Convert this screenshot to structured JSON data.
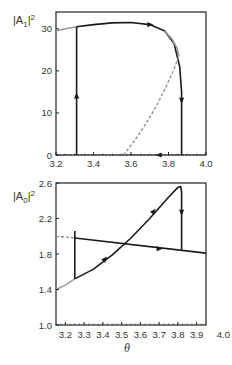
{
  "chart_data": [
    {
      "type": "line",
      "panel": "top",
      "ylabel": "|A1|^2",
      "ylabel_parts": {
        "base": "|A",
        "sub": "1",
        "tail": "|",
        "sup": "2"
      },
      "xlabel": "",
      "xlim": [
        3.2,
        4.0
      ],
      "ylim": [
        0,
        34
      ],
      "xticks": [
        3.2,
        3.4,
        3.6,
        3.8,
        4.0
      ],
      "xtick_labels": [
        "3.2",
        "3.4",
        "3.6",
        "3.8",
        "4.0"
      ],
      "yticks": [
        0,
        10,
        20,
        30
      ],
      "ytick_labels": [
        "0",
        "10",
        "20",
        "30"
      ],
      "grid": false,
      "series": [
        {
          "name": "stable upper branch (gray)",
          "style": "solid-gray",
          "x": [
            3.2,
            3.25,
            3.31
          ],
          "y": [
            29.5,
            30.0,
            30.5
          ]
        },
        {
          "name": "stable upper branch (black)",
          "style": "solid-black",
          "x": [
            3.31,
            3.4,
            3.5,
            3.6,
            3.7,
            3.78,
            3.83,
            3.86,
            3.87,
            3.87
          ],
          "y": [
            30.5,
            31.0,
            31.4,
            31.5,
            31.0,
            29.5,
            26.5,
            21.0,
            15.0,
            0
          ]
        },
        {
          "name": "upper branch near fold (gray)",
          "style": "solid-gray",
          "x": [
            3.78,
            3.82,
            3.845,
            3.855
          ],
          "y": [
            29.5,
            27.5,
            25.5,
            23.5
          ]
        },
        {
          "name": "unstable branch",
          "style": "dashed-gray",
          "x": [
            3.56,
            3.62,
            3.68,
            3.74,
            3.79,
            3.83,
            3.855
          ],
          "y": [
            0,
            3.5,
            7.5,
            12.0,
            16.5,
            20.5,
            23.5
          ]
        },
        {
          "name": "trivial branch",
          "style": "dashed-black",
          "x": [
            3.2,
            4.0
          ],
          "y": [
            0,
            0
          ]
        },
        {
          "name": "jump up",
          "style": "solid-black",
          "x": [
            3.31,
            3.31
          ],
          "y": [
            0,
            30.5
          ]
        }
      ],
      "arrows": [
        {
          "x": 3.31,
          "y": 14,
          "direction": "up"
        },
        {
          "x": 3.7,
          "y": 31.0,
          "direction": "right"
        },
        {
          "x": 3.87,
          "y": 13,
          "direction": "down"
        },
        {
          "x": 3.75,
          "y": 0,
          "direction": "left"
        }
      ]
    },
    {
      "type": "line",
      "panel": "bottom",
      "ylabel": "|A0|^2",
      "ylabel_parts": {
        "base": "|A",
        "sub": "0",
        "tail": "|",
        "sup": "2"
      },
      "xlabel": "θ",
      "xlim": [
        3.15,
        3.95
      ],
      "ylim": [
        1.0,
        2.6
      ],
      "xticks": [
        3.2,
        3.3,
        3.4,
        3.5,
        3.6,
        3.7,
        3.8,
        3.9,
        4.0
      ],
      "xtick_labels": [
        "3.2",
        "3.3",
        "3.4",
        "3.5",
        "3.6",
        "3.7",
        "3.8",
        "3.9",
        "4.0"
      ],
      "yticks": [
        1.0,
        1.4,
        1.8,
        2.2,
        2.6
      ],
      "ytick_labels": [
        "1.0",
        "1.4",
        "1.8",
        "2.2",
        "2.6"
      ],
      "grid": false,
      "series": [
        {
          "name": "rising branch (gray)",
          "style": "solid-gray",
          "x": [
            3.15,
            3.2,
            3.25
          ],
          "y": [
            1.4,
            1.45,
            1.52
          ]
        },
        {
          "name": "rising branch (black)",
          "style": "solid-black",
          "x": [
            3.25,
            3.35,
            3.45,
            3.55,
            3.65,
            3.75,
            3.8,
            3.815,
            3.82,
            3.82
          ],
          "y": [
            1.52,
            1.63,
            1.79,
            1.98,
            2.2,
            2.44,
            2.55,
            2.56,
            2.5,
            1.84
          ]
        },
        {
          "name": "descending line",
          "style": "solid-black",
          "x": [
            3.25,
            3.95
          ],
          "y": [
            1.98,
            1.81
          ]
        },
        {
          "name": "dashed continuation",
          "style": "dashed-gray",
          "x": [
            3.15,
            3.25
          ],
          "y": [
            2.0,
            1.98
          ]
        },
        {
          "name": "jump",
          "style": "solid-black",
          "x": [
            3.25,
            3.25
          ],
          "y": [
            2.06,
            1.52
          ]
        }
      ],
      "arrows": [
        {
          "x": 3.41,
          "y": 1.74,
          "direction": "up-right"
        },
        {
          "x": 3.67,
          "y": 2.28,
          "direction": "up-right"
        },
        {
          "x": 3.82,
          "y": 2.27,
          "direction": "down"
        },
        {
          "x": 3.7,
          "y": 1.86,
          "direction": "right"
        }
      ]
    }
  ],
  "colors": {
    "black_line": "#1a1a1a",
    "gray_line": "#9a9a9a",
    "dashed": "#8a8a8a",
    "axis": "#222222"
  }
}
